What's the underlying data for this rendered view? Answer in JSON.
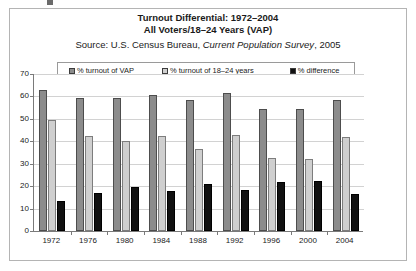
{
  "figure": {
    "title_line_1": "Turnout Differential: 1972–2004",
    "title_line_2": "All Voters/18–24 Years (VAP)",
    "source_prefix": "Source: U.S. Census Bureau, ",
    "source_italic": "Current Population Survey",
    "source_suffix": ", 2005"
  },
  "colors": {
    "series_vap": "#8c8c8c",
    "series_young": "#cfcfcf",
    "series_difference": "#111111",
    "gridline": "#d2d2d2",
    "axis": "#7a7a7a",
    "frame": "#b4b4b4",
    "text": "#1a1a1a",
    "background": "#ffffff"
  },
  "legend": {
    "position": "top-inside",
    "entries": [
      {
        "label": "% turnout of VAP",
        "swatch": "#8c8c8c"
      },
      {
        "label": "% turnout of 18–24 years",
        "swatch": "#cfcfcf"
      },
      {
        "label": "% difference",
        "swatch": "#111111"
      }
    ]
  },
  "axes": {
    "y_ticks": [
      "70",
      "60",
      "50",
      "40",
      "30",
      "20",
      "10",
      "0"
    ],
    "y_min": 0,
    "y_max": 70,
    "y_step": 10,
    "grid": true
  },
  "chart_data": {
    "type": "bar",
    "title": "Turnout Differential: 1972–2004 All Voters/18–24 Years (VAP)",
    "subtitle": "Source: U.S. Census Bureau, Current Population Survey, 2005",
    "xlabel": "",
    "ylabel": "",
    "ylim": [
      0,
      70
    ],
    "categories": [
      "1972",
      "1976",
      "1980",
      "1984",
      "1988",
      "1992",
      "1996",
      "2000",
      "2004"
    ],
    "series": [
      {
        "name": "% turnout of VAP",
        "color": "#8c8c8c",
        "values": [
          63,
          59.5,
          59.5,
          60.5,
          58.5,
          61.5,
          54.5,
          54.5,
          58.5
        ]
      },
      {
        "name": "% turnout of 18–24 years",
        "color": "#cfcfcf",
        "values": [
          49.5,
          42.5,
          40,
          42.5,
          36.5,
          43,
          32.5,
          32,
          42
        ]
      },
      {
        "name": "% difference",
        "color": "#111111",
        "values": [
          13.5,
          17,
          19.5,
          18,
          21,
          18.5,
          22,
          22.5,
          16.5
        ]
      }
    ],
    "legend_position": "top"
  }
}
